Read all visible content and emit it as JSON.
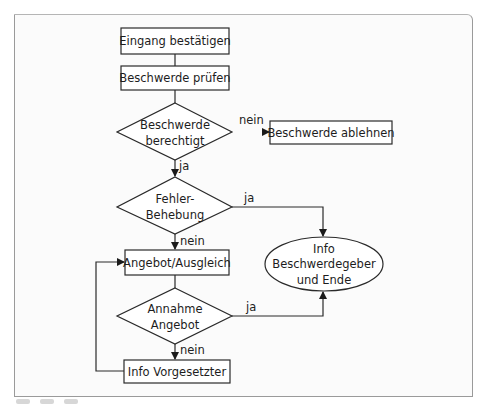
{
  "diagram": {
    "type": "flowchart",
    "colors": {
      "stroke": "#2a2a2a",
      "frame": "#9a9a9a",
      "background": "#fbfbfb"
    },
    "nodes": {
      "n1": {
        "shape": "rect",
        "label": "Eingang bestätigen"
      },
      "n2": {
        "shape": "rect",
        "label": "Beschwerde prüfen"
      },
      "d1": {
        "shape": "diamond",
        "line1": "Beschwerde",
        "line2": "berechtigt"
      },
      "n3": {
        "shape": "rect",
        "label": "Beschwerde ablehnen"
      },
      "d2": {
        "shape": "diamond",
        "line1": "Fehler-",
        "line2": "Behebung"
      },
      "n4": {
        "shape": "rect",
        "label": "Angebot/Ausgleich"
      },
      "end": {
        "shape": "ellipse",
        "line1": "Info",
        "line2": "Beschwerdegeber",
        "line3": "und Ende"
      },
      "d3": {
        "shape": "diamond",
        "line1": "Annahme",
        "line2": "Angebot"
      },
      "n5": {
        "shape": "rect",
        "label": "Info Vorgesetzter"
      }
    },
    "edges": {
      "e1": {
        "from": "n1",
        "to": "n2",
        "label": ""
      },
      "e2": {
        "from": "n2",
        "to": "d1",
        "label": ""
      },
      "e3": {
        "from": "d1",
        "to": "n3",
        "label": "nein"
      },
      "e4": {
        "from": "d1",
        "to": "d2",
        "label": "ja"
      },
      "e5": {
        "from": "d2",
        "to": "end",
        "label": "ja"
      },
      "e6": {
        "from": "d2",
        "to": "n4",
        "label": "nein"
      },
      "e7": {
        "from": "n4",
        "to": "d3",
        "label": ""
      },
      "e8": {
        "from": "d3",
        "to": "end",
        "label": "ja"
      },
      "e9": {
        "from": "d3",
        "to": "n5",
        "label": "nein"
      },
      "e10": {
        "from": "n5",
        "to": "n4",
        "label": ""
      }
    }
  }
}
